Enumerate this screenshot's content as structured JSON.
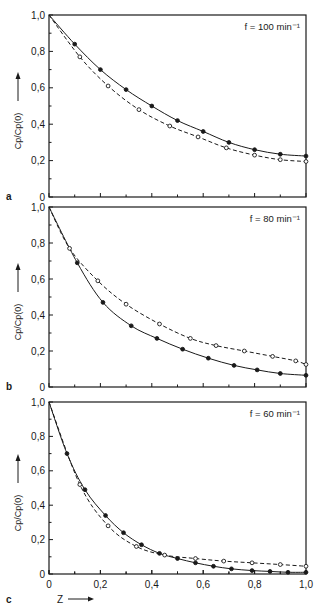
{
  "figure": {
    "ylabel": "Cp/Cp(0)",
    "xlabel": "Z",
    "x_ticks": [
      "0",
      "0,2",
      "0,4",
      "0,6",
      "0,8",
      "1,0"
    ],
    "y_ticks": [
      "0",
      "0,2",
      "0,4",
      "0,6",
      "0,8",
      "1,0"
    ]
  },
  "panels": [
    {
      "letter": "a",
      "annotation": "f = 100 min⁻¹"
    },
    {
      "letter": "b",
      "annotation": "f =  80 min⁻¹"
    },
    {
      "letter": "c",
      "annotation": "f = 60 min⁻¹"
    }
  ],
  "chart_data": [
    {
      "type": "line",
      "panel": "a",
      "title": "f = 100 min^-1",
      "xlabel": "",
      "ylabel": "Cp/Cp(0)",
      "xlim": [
        0,
        1.0
      ],
      "ylim": [
        0,
        1.0
      ],
      "x_ticks": [
        0,
        0.2,
        0.4,
        0.6,
        0.8,
        1.0
      ],
      "y_ticks": [
        0,
        0.2,
        0.4,
        0.6,
        0.8,
        1.0
      ],
      "grid": false,
      "series": [
        {
          "name": "filled circles (solid line)",
          "marker": "filled",
          "line": "solid",
          "x": [
            0,
            0.1,
            0.2,
            0.3,
            0.4,
            0.5,
            0.6,
            0.7,
            0.8,
            0.9,
            1.0
          ],
          "y": [
            1.0,
            0.84,
            0.7,
            0.59,
            0.5,
            0.42,
            0.36,
            0.3,
            0.26,
            0.235,
            0.225
          ]
        },
        {
          "name": "open circles (dashed line)",
          "marker": "open",
          "line": "dashed",
          "x": [
            0,
            0.12,
            0.23,
            0.35,
            0.47,
            0.58,
            0.69,
            0.8,
            0.9,
            1.0
          ],
          "y": [
            1.0,
            0.77,
            0.61,
            0.48,
            0.39,
            0.33,
            0.27,
            0.23,
            0.205,
            0.195
          ]
        }
      ]
    },
    {
      "type": "line",
      "panel": "b",
      "title": "f = 80 min^-1",
      "xlabel": "",
      "ylabel": "Cp/Cp(0)",
      "xlim": [
        0,
        1.0
      ],
      "ylim": [
        0,
        1.0
      ],
      "x_ticks": [
        0,
        0.2,
        0.4,
        0.6,
        0.8,
        1.0
      ],
      "y_ticks": [
        0,
        0.2,
        0.4,
        0.6,
        0.8,
        1.0
      ],
      "grid": false,
      "series": [
        {
          "name": "filled circles (solid line)",
          "marker": "filled",
          "line": "solid",
          "x": [
            0,
            0.11,
            0.21,
            0.32,
            0.42,
            0.52,
            0.62,
            0.72,
            0.81,
            0.9,
            1.0
          ],
          "y": [
            1.0,
            0.69,
            0.47,
            0.34,
            0.27,
            0.21,
            0.16,
            0.12,
            0.095,
            0.075,
            0.065
          ]
        },
        {
          "name": "open circles (dashed line)",
          "marker": "open",
          "line": "dashed",
          "x": [
            0,
            0.08,
            0.19,
            0.3,
            0.43,
            0.55,
            0.65,
            0.76,
            0.87,
            0.96,
            1.0
          ],
          "y": [
            1.0,
            0.77,
            0.59,
            0.46,
            0.35,
            0.27,
            0.23,
            0.2,
            0.17,
            0.145,
            0.125
          ]
        }
      ]
    },
    {
      "type": "line",
      "panel": "c",
      "title": "f = 60 min^-1",
      "xlabel": "Z",
      "ylabel": "Cp/Cp(0)",
      "xlim": [
        0,
        1.0
      ],
      "ylim": [
        0,
        1.0
      ],
      "x_ticks": [
        0,
        0.2,
        0.4,
        0.6,
        0.8,
        1.0
      ],
      "y_ticks": [
        0,
        0.2,
        0.4,
        0.6,
        0.8,
        1.0
      ],
      "grid": false,
      "series": [
        {
          "name": "filled circles (solid line)",
          "marker": "filled",
          "line": "solid",
          "x": [
            0,
            0.07,
            0.14,
            0.22,
            0.29,
            0.36,
            0.43,
            0.5,
            0.57,
            0.64,
            0.71,
            0.79,
            0.86,
            0.93,
            1.0
          ],
          "y": [
            1.0,
            0.7,
            0.49,
            0.34,
            0.24,
            0.17,
            0.12,
            0.09,
            0.065,
            0.045,
            0.03,
            0.02,
            0.015,
            0.01,
            0.01
          ]
        },
        {
          "name": "open circles (dashed line)",
          "marker": "open",
          "line": "dashed",
          "x": [
            0,
            0.12,
            0.23,
            0.34,
            0.45,
            0.57,
            0.68,
            0.79,
            0.9,
            1.0
          ],
          "y": [
            1.0,
            0.52,
            0.28,
            0.16,
            0.11,
            0.09,
            0.075,
            0.065,
            0.055,
            0.045
          ]
        }
      ]
    }
  ]
}
